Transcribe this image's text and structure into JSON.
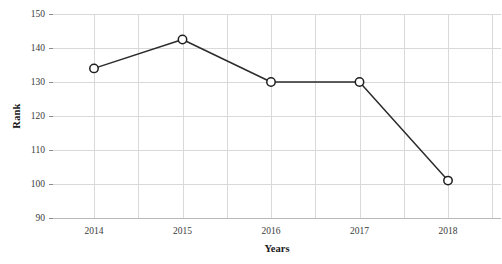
{
  "chart_data": {
    "type": "line",
    "title": "",
    "xlabel": "Years",
    "ylabel": "Rank",
    "categories": [
      "2014",
      "2015",
      "2016",
      "2017",
      "2018"
    ],
    "values": [
      134,
      142.5,
      130,
      130,
      101
    ],
    "series": [
      {
        "name": "Rank",
        "values": [
          134,
          142.5,
          130,
          130,
          101
        ]
      }
    ],
    "x_tick_labels": [
      "2014",
      "2015",
      "2016",
      "2017",
      "2018"
    ],
    "y_tick_labels": [
      "90",
      "100",
      "110",
      "120",
      "130",
      "140",
      "150"
    ],
    "y_tick_values": [
      90,
      100,
      110,
      120,
      130,
      140,
      150
    ],
    "ylim": [
      150,
      90
    ],
    "y_axis_inverted": true,
    "grid": true,
    "grid_color": "#d9d9d9",
    "legend": "none",
    "line_color": "#2b2b2b",
    "marker_style": "open-circle",
    "marker_fill": "#ffffff",
    "background_color": "#ffffff",
    "vertical_gridline_count": 11
  },
  "axes": {
    "y_title": "Rank",
    "x_title": "Years"
  }
}
